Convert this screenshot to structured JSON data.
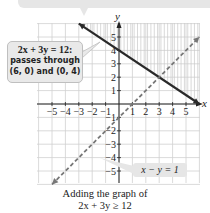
{
  "chart_data": {
    "type": "line",
    "title": "",
    "xlabel": "x",
    "ylabel": "y",
    "xlim": [
      -6,
      6
    ],
    "ylim": [
      -6,
      6
    ],
    "grid": true,
    "x_tick_labels": [
      "-5",
      "-4",
      "-3",
      "-2",
      "-1",
      "1",
      "2",
      "3",
      "4",
      "5"
    ],
    "y_tick_labels": [
      "5",
      "4",
      "3",
      "2",
      "1",
      "-1",
      "-2",
      "-3",
      "-4",
      "-5"
    ],
    "series": [
      {
        "name": "2x + 3y = 12",
        "style": "solid",
        "color": "#2a2a2a",
        "points": [
          [
            -3,
            6
          ],
          [
            6,
            0
          ]
        ],
        "shaded_region": "above (2x + 3y >= 12)"
      },
      {
        "name": "x - y = 1",
        "style": "dashed",
        "color": "#777777",
        "points": [
          [
            -5,
            -6
          ],
          [
            6,
            5
          ]
        ]
      }
    ],
    "annotations": [
      {
        "text_lines": [
          "2x + 3y = 12:",
          "passes through",
          "(6, 0) and (0, 4)"
        ],
        "target": "solid line"
      },
      {
        "text": "x − y = 1",
        "target": "dashed line"
      }
    ],
    "caption": [
      "Adding the graph of",
      "2x + 3y ≥ 12"
    ]
  },
  "callout": {
    "line1": "2x + 3y = 12:",
    "line2": "passes through",
    "line3": "(6, 0) and (0, 4)"
  },
  "dashed_label": "x − y = 1",
  "caption": {
    "line1": "Adding the graph of",
    "line2": "2x + 3y ≥ 12"
  },
  "axis": {
    "x": "x",
    "y": "y"
  }
}
